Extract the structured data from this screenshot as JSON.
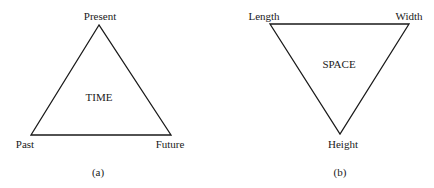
{
  "diagram_a": {
    "center_label": "TIME",
    "vertices": {
      "top": "Present",
      "bottom_left": "Past",
      "bottom_right": "Future"
    },
    "caption": "(a)"
  },
  "diagram_b": {
    "center_label": "SPACE",
    "vertices": {
      "top_left": "Length",
      "top_right": "Width",
      "bottom": "Height"
    },
    "caption": "(b)"
  },
  "colors": {
    "stroke": "#1a1a1a",
    "background": "#ffffff"
  }
}
